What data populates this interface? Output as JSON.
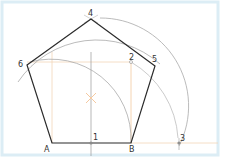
{
  "diagram": {
    "colors": {
      "frame": "#dcedf5",
      "polygon": "#2b2b2b",
      "construction_arc": "#a9a9a9",
      "construction_line": "#f2c9a0",
      "axis_line": "#9a9a9a",
      "center_mark": "#f5b98a",
      "point": "#8a8a8a"
    },
    "points": {
      "A": {
        "label": "A",
        "x": 52,
        "y": 143
      },
      "B": {
        "label": "B",
        "x": 131,
        "y": 143
      },
      "p1": {
        "label": "1",
        "x": 91,
        "y": 143
      },
      "p2": {
        "label": "2",
        "x": 131,
        "y": 62
      },
      "p3": {
        "label": "3",
        "x": 179,
        "y": 143
      },
      "p4": {
        "label": "4",
        "x": 91,
        "y": 19
      },
      "p5": {
        "label": "5",
        "x": 155,
        "y": 66
      },
      "p6": {
        "label": "6",
        "x": 27,
        "y": 65
      }
    },
    "labels": {
      "A": "A",
      "B": "B",
      "p1": "1",
      "p2": "2",
      "p3": "3",
      "p4": "4",
      "p5": "5",
      "p6": "6"
    }
  }
}
